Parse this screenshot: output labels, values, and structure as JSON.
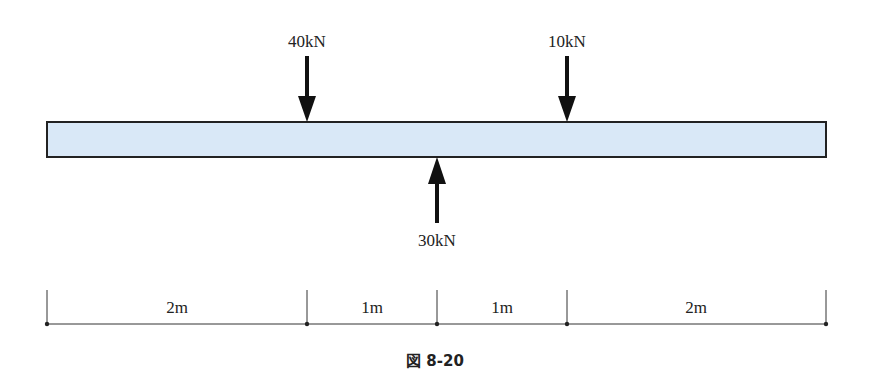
{
  "diagram": {
    "type": "beam-loading",
    "beam": {
      "fill": "#d9e8f7",
      "stroke": "#222222"
    },
    "loads": [
      {
        "label": "40kN",
        "direction": "down",
        "position_m": 2
      },
      {
        "label": "10kN",
        "direction": "down",
        "position_m": 4
      },
      {
        "label": "30kN",
        "direction": "up",
        "position_m": 3
      }
    ],
    "dimensions": [
      {
        "label": "2m",
        "from_m": 0,
        "to_m": 2
      },
      {
        "label": "1m",
        "from_m": 2,
        "to_m": 3
      },
      {
        "label": "1m",
        "from_m": 3,
        "to_m": 4
      },
      {
        "label": "2m",
        "from_m": 4,
        "to_m": 6
      }
    ],
    "caption": "図 8-20"
  }
}
